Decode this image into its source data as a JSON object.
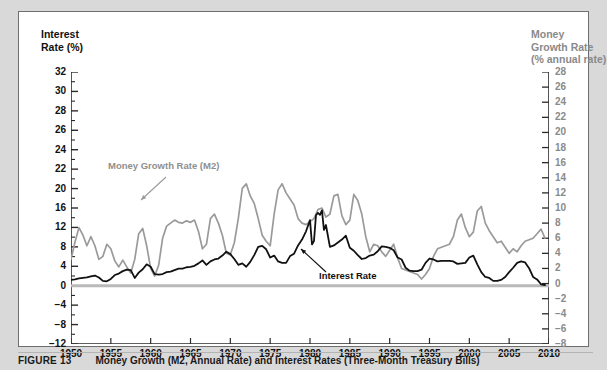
{
  "figure": {
    "caption_label": "FIGURE 13",
    "caption_text": "Money Growth (M2, Annual Rate) and Interest Rates (Three-Month Treasury Bills)"
  },
  "axes": {
    "left_title": "Interest\nRate (%)",
    "right_title": "Money\nGrowth Rate\n(% annual rate)",
    "left_ticks": [
      "32",
      "30",
      "28",
      "26",
      "24",
      "22",
      "20",
      "16",
      "12",
      "8",
      "4",
      "0",
      "-4",
      "-8",
      "-12"
    ],
    "right_ticks": [
      "28",
      "26",
      "24",
      "22",
      "20",
      "18",
      "16",
      "14",
      "12",
      "10",
      "8",
      "6",
      "4",
      "2",
      "0",
      "-2",
      "-4",
      "-6",
      "-8"
    ],
    "x_ticks": [
      "1950",
      "1955",
      "1960",
      "1965",
      "1970",
      "1975",
      "1980",
      "1985",
      "1990",
      "1995",
      "2000",
      "2005",
      "2010"
    ]
  },
  "annotations": {
    "money": "Money Growth Rate (M2)",
    "interest": "Interest Rate"
  },
  "colors": {
    "money_line": "#9a9a9a",
    "interest_line": "#111111",
    "panel_bg": "#ffffff",
    "page_bg": "#d9d9d9",
    "axis": "#2b2b2b",
    "right_axis_text": "#8a8a8a"
  },
  "chart_data": {
    "type": "line",
    "title": "Money Growth (M2, Annual Rate) and Interest Rates (Three-Month Treasury Bills)",
    "xlabel": "",
    "ylabel": "Interest Rate (%)",
    "y2label": "Money Growth Rate (% annual rate)",
    "xlim": [
      1950,
      2010
    ],
    "ylim": [
      -12,
      32
    ],
    "y2lim": [
      -8,
      28
    ],
    "grid": false,
    "legend": "inline-annotations",
    "series": [
      {
        "name": "Money Growth Rate (M2)",
        "axis": "right",
        "color": "#9a9a9a",
        "x": [
          1950,
          1950.5,
          1951,
          1951.5,
          1952,
          1952.5,
          1953,
          1953.5,
          1954,
          1954.5,
          1955,
          1955.5,
          1956,
          1956.5,
          1957,
          1957.5,
          1958,
          1958.5,
          1959,
          1959.5,
          1960,
          1960.5,
          1961,
          1961.5,
          1962,
          1962.5,
          1963,
          1963.5,
          1964,
          1964.5,
          1965,
          1965.5,
          1966,
          1966.5,
          1967,
          1967.5,
          1968,
          1968.5,
          1969,
          1969.5,
          1970,
          1970.5,
          1971,
          1971.5,
          1972,
          1972.5,
          1973,
          1973.5,
          1974,
          1974.5,
          1975,
          1975.5,
          1976,
          1976.5,
          1977,
          1977.5,
          1978,
          1978.5,
          1979,
          1979.5,
          1980,
          1980.5,
          1981,
          1981.5,
          1982,
          1982.5,
          1983,
          1983.5,
          1984,
          1984.5,
          1985,
          1985.5,
          1986,
          1986.5,
          1987,
          1987.5,
          1988,
          1988.5,
          1989,
          1989.5,
          1990,
          1990.5,
          1991,
          1991.5,
          1992,
          1992.5,
          1993,
          1993.5,
          1994,
          1994.5,
          1995,
          1995.5,
          1996,
          1996.5,
          1997,
          1997.5,
          1998,
          1998.5,
          1999,
          1999.5,
          2000,
          2000.5,
          2001,
          2001.5,
          2002,
          2002.5,
          2003,
          2003.5,
          2004,
          2004.5,
          2005,
          2005.5,
          2006,
          2006.5,
          2007,
          2007.5,
          2008,
          2008.5,
          2009,
          2009.5
        ],
        "values": [
          3.2,
          5.5,
          7.4,
          6.4,
          5.0,
          6.2,
          5.0,
          3.2,
          3.6,
          5.2,
          4.6,
          3.0,
          2.2,
          3.1,
          2.2,
          1.4,
          3.2,
          6.6,
          7.3,
          5.0,
          2.0,
          1.0,
          2.4,
          6.0,
          7.6,
          8.0,
          8.4,
          8.1,
          8.0,
          8.3,
          8.1,
          8.4,
          6.9,
          4.6,
          5.2,
          8.6,
          9.2,
          8.0,
          6.4,
          4.0,
          3.8,
          5.4,
          8.6,
          12.6,
          13.2,
          11.6,
          10.6,
          8.6,
          6.4,
          5.6,
          5.0,
          9.2,
          12.4,
          13.2,
          12.0,
          11.2,
          10.4,
          8.6,
          8.0,
          7.8,
          8.2,
          8.6,
          9.8,
          10.0,
          8.8,
          9.2,
          11.6,
          11.8,
          9.0,
          7.8,
          8.4,
          11.8,
          11.0,
          9.2,
          6.2,
          4.2,
          5.2,
          5.0,
          4.2,
          3.6,
          4.4,
          5.2,
          3.4,
          2.0,
          1.8,
          1.6,
          1.4,
          1.2,
          0.6,
          1.2,
          2.0,
          3.6,
          4.6,
          4.8,
          5.0,
          5.2,
          6.2,
          8.4,
          9.2,
          7.4,
          6.2,
          6.8,
          9.6,
          10.2,
          8.0,
          7.0,
          6.2,
          5.4,
          5.6,
          4.8,
          4.0,
          4.6,
          4.2,
          5.0,
          5.6,
          5.8,
          6.0,
          6.6,
          7.2,
          6.0
        ]
      },
      {
        "name": "Interest Rate (Three-Month Treasury Bills)",
        "axis": "left",
        "color": "#111111",
        "x": [
          1950,
          1950.5,
          1951,
          1951.5,
          1952,
          1952.5,
          1953,
          1953.5,
          1954,
          1954.5,
          1955,
          1955.5,
          1956,
          1956.5,
          1957,
          1957.5,
          1958,
          1958.5,
          1959,
          1959.5,
          1960,
          1960.5,
          1961,
          1961.5,
          1962,
          1962.5,
          1963,
          1963.5,
          1964,
          1964.5,
          1965,
          1965.5,
          1966,
          1966.5,
          1967,
          1967.5,
          1968,
          1968.5,
          1969,
          1969.5,
          1970,
          1970.5,
          1971,
          1971.5,
          1972,
          1972.5,
          1973,
          1973.5,
          1974,
          1974.5,
          1975,
          1975.5,
          1976,
          1976.5,
          1977,
          1977.5,
          1978,
          1978.5,
          1979,
          1979.5,
          1980,
          1980.25,
          1980.5,
          1980.75,
          1981,
          1981.25,
          1981.5,
          1981.75,
          1982,
          1982.5,
          1983,
          1983.5,
          1984,
          1984.5,
          1985,
          1985.5,
          1986,
          1986.5,
          1987,
          1987.5,
          1988,
          1988.5,
          1989,
          1989.5,
          1990,
          1990.5,
          1991,
          1991.5,
          1992,
          1992.5,
          1993,
          1993.5,
          1994,
          1994.5,
          1995,
          1995.5,
          1996,
          1996.5,
          1997,
          1997.5,
          1998,
          1998.5,
          1999,
          1999.5,
          2000,
          2000.5,
          2001,
          2001.5,
          2002,
          2002.5,
          2003,
          2003.5,
          2004,
          2004.5,
          2005,
          2005.5,
          2006,
          2006.5,
          2007,
          2007.5,
          2008,
          2008.5,
          2009,
          2009.5
        ],
        "values": [
          1.2,
          1.3,
          1.5,
          1.6,
          1.7,
          1.9,
          2.1,
          1.7,
          1.0,
          0.9,
          1.4,
          2.2,
          2.5,
          3.0,
          3.3,
          3.2,
          1.6,
          2.7,
          3.4,
          4.4,
          3.9,
          2.4,
          2.3,
          2.4,
          2.8,
          2.9,
          3.2,
          3.5,
          3.5,
          3.8,
          3.9,
          4.1,
          4.6,
          5.2,
          4.3,
          5.0,
          5.4,
          5.6,
          6.2,
          7.0,
          6.5,
          5.5,
          4.3,
          4.6,
          3.9,
          4.9,
          6.3,
          8.0,
          8.2,
          7.5,
          5.8,
          6.2,
          5.0,
          4.7,
          4.7,
          6.1,
          6.6,
          8.3,
          9.5,
          11.2,
          13.5,
          8.5,
          9.2,
          14.5,
          15.0,
          14.6,
          15.5,
          11.5,
          12.5,
          8.0,
          8.3,
          8.9,
          9.5,
          10.3,
          7.8,
          7.2,
          6.3,
          5.5,
          5.7,
          6.2,
          6.4,
          7.1,
          8.1,
          8.0,
          7.8,
          7.3,
          5.8,
          5.4,
          3.7,
          3.1,
          3.0,
          3.0,
          3.3,
          4.7,
          5.6,
          5.4,
          5.0,
          5.1,
          5.1,
          5.1,
          5.0,
          4.5,
          4.6,
          4.7,
          5.8,
          6.2,
          4.4,
          2.8,
          1.8,
          1.6,
          1.0,
          1.0,
          1.2,
          1.8,
          2.8,
          3.7,
          4.7,
          5.0,
          4.8,
          3.6,
          1.8,
          1.3,
          0.3,
          0.15
        ]
      }
    ]
  }
}
